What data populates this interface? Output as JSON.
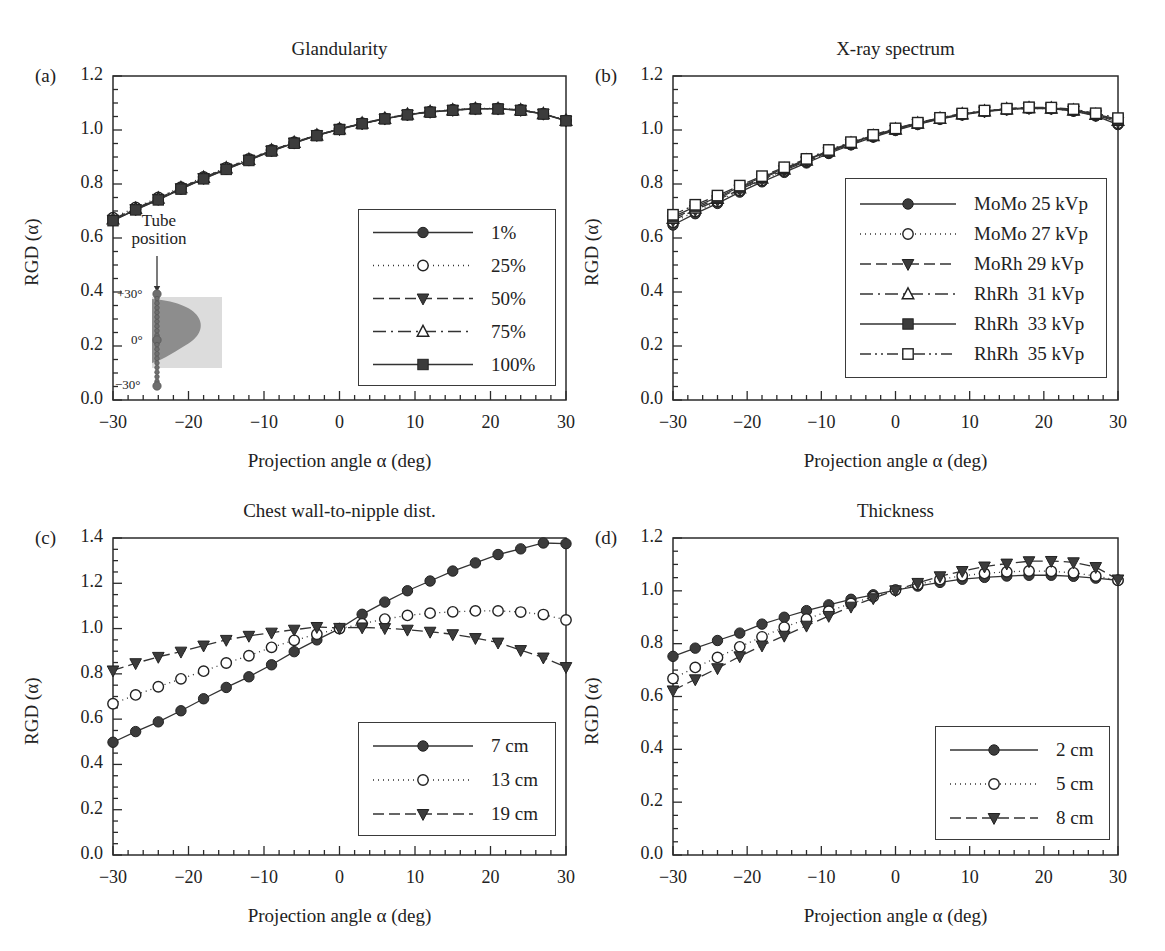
{
  "figure": {
    "background": "#ffffff",
    "ink": "#2b2b2b",
    "axis_title_x": "Projection angle α (deg)",
    "axis_title_y": "RGD (α)"
  },
  "panels": [
    {
      "key": "a",
      "label": "(a)",
      "title": "Glandularity",
      "frame": {
        "x": 113,
        "y": 76,
        "w": 453,
        "h": 324
      },
      "legend": {
        "x": 358,
        "y": 209,
        "w": 198,
        "h": 177,
        "row_h": 33,
        "sample_w": 108
      }
    },
    {
      "key": "b",
      "label": "(b)",
      "title": "X-ray spectrum",
      "frame": {
        "x": 673,
        "y": 76,
        "w": 445,
        "h": 324
      },
      "legend": {
        "x": 845,
        "y": 178,
        "w": 262,
        "h": 200,
        "row_h": 30,
        "sample_w": 104
      }
    },
    {
      "key": "c",
      "label": "(c)",
      "title": "Chest wall-to-nipple dist.",
      "frame": {
        "x": 113,
        "y": 538,
        "w": 453,
        "h": 317
      },
      "legend": {
        "x": 358,
        "y": 722,
        "w": 198,
        "h": 114,
        "row_h": 34,
        "sample_w": 108
      }
    },
    {
      "key": "d",
      "label": "(d)",
      "title": "Thickness",
      "frame": {
        "x": 673,
        "y": 538,
        "w": 445,
        "h": 317
      },
      "legend": {
        "x": 935,
        "y": 726,
        "w": 175,
        "h": 114,
        "row_h": 34,
        "sample_w": 96
      }
    }
  ],
  "inset": {
    "panel": "a",
    "note": "Tube\nposition",
    "note_line1": "Tube",
    "note_line2": "position",
    "labels": [
      "+30°",
      "0°",
      "−30°"
    ],
    "box": {
      "x": 152,
      "y": 297,
      "w": 70,
      "h": 71
    },
    "arrow": {
      "x": 157,
      "y": 256,
      "len": 34
    }
  },
  "chart_data": [
    {
      "type": "line",
      "panel": "a",
      "title": "Glandularity",
      "xlabel": "Projection angle α (deg)",
      "ylabel": "RGD (α)",
      "xlim": [
        -30,
        30
      ],
      "ylim": [
        0.0,
        1.2
      ],
      "xticks": [
        -30,
        -20,
        -10,
        0,
        10,
        20,
        30
      ],
      "yticks": [
        0.0,
        0.2,
        0.4,
        0.6,
        0.8,
        1.0,
        1.2
      ],
      "minor_ticks": true,
      "grid": false,
      "legend_position": "lower-right-inside",
      "x": [
        -30,
        -27,
        -24,
        -21,
        -18,
        -15,
        -12,
        -9,
        -6,
        -3,
        0,
        3,
        6,
        9,
        12,
        15,
        18,
        21,
        24,
        27,
        30
      ],
      "series": [
        {
          "name": "1%",
          "marker": "filled-circle",
          "line": "solid",
          "values": [
            0.665,
            0.705,
            0.742,
            0.782,
            0.82,
            0.855,
            0.888,
            0.923,
            0.952,
            0.98,
            1.003,
            1.024,
            1.042,
            1.057,
            1.067,
            1.074,
            1.079,
            1.079,
            1.074,
            1.06,
            1.035
          ]
        },
        {
          "name": "25%",
          "marker": "open-circle",
          "line": "dotted",
          "values": [
            0.675,
            0.713,
            0.75,
            0.788,
            0.826,
            0.861,
            0.893,
            0.926,
            0.955,
            0.982,
            1.004,
            1.025,
            1.043,
            1.058,
            1.068,
            1.075,
            1.08,
            1.08,
            1.075,
            1.061,
            1.036
          ]
        },
        {
          "name": "50%",
          "marker": "filled-triangle-down",
          "line": "dashed",
          "values": [
            0.668,
            0.707,
            0.745,
            0.784,
            0.822,
            0.857,
            0.89,
            0.924,
            0.953,
            0.981,
            1.003,
            1.024,
            1.042,
            1.057,
            1.067,
            1.074,
            1.079,
            1.079,
            1.074,
            1.06,
            1.035
          ]
        },
        {
          "name": "75%",
          "marker": "open-triangle-up",
          "line": "dashdot",
          "values": [
            0.67,
            0.709,
            0.747,
            0.786,
            0.824,
            0.859,
            0.891,
            0.925,
            0.954,
            0.981,
            1.004,
            1.025,
            1.043,
            1.058,
            1.068,
            1.074,
            1.079,
            1.079,
            1.074,
            1.06,
            1.035
          ]
        },
        {
          "name": "100%",
          "marker": "filled-square",
          "line": "solid",
          "values": [
            0.664,
            0.704,
            0.741,
            0.781,
            0.819,
            0.854,
            0.887,
            0.922,
            0.951,
            0.979,
            1.002,
            1.023,
            1.041,
            1.056,
            1.066,
            1.073,
            1.078,
            1.078,
            1.073,
            1.059,
            1.034
          ]
        }
      ]
    },
    {
      "type": "line",
      "panel": "b",
      "title": "X-ray spectrum",
      "xlabel": "Projection angle α (deg)",
      "ylabel": "RGD (α)",
      "xlim": [
        -30,
        30
      ],
      "ylim": [
        0.0,
        1.2
      ],
      "xticks": [
        -30,
        -20,
        -10,
        0,
        10,
        20,
        30
      ],
      "yticks": [
        0.0,
        0.2,
        0.4,
        0.6,
        0.8,
        1.0,
        1.2
      ],
      "minor_ticks": true,
      "grid": false,
      "legend_position": "center-right-inside",
      "x": [
        -30,
        -27,
        -24,
        -21,
        -18,
        -15,
        -12,
        -9,
        -6,
        -3,
        0,
        3,
        6,
        9,
        12,
        15,
        18,
        21,
        24,
        27,
        30
      ],
      "series": [
        {
          "name": "MoMo 25 kVp",
          "marker": "filled-circle",
          "line": "solid",
          "values": [
            0.648,
            0.69,
            0.728,
            0.77,
            0.808,
            0.843,
            0.878,
            0.913,
            0.945,
            0.974,
            0.999,
            1.021,
            1.04,
            1.056,
            1.068,
            1.076,
            1.08,
            1.079,
            1.07,
            1.052,
            1.02
          ]
        },
        {
          "name": "MoMo 27 kVp",
          "marker": "open-circle",
          "line": "dotted",
          "values": [
            0.658,
            0.698,
            0.735,
            0.776,
            0.813,
            0.848,
            0.882,
            0.916,
            0.947,
            0.976,
            1.0,
            1.022,
            1.041,
            1.057,
            1.069,
            1.076,
            1.08,
            1.079,
            1.071,
            1.054,
            1.025
          ]
        },
        {
          "name": "MoRh 29 kVp",
          "marker": "filled-triangle-down",
          "line": "dashed",
          "values": [
            0.665,
            0.704,
            0.74,
            0.78,
            0.817,
            0.851,
            0.884,
            0.918,
            0.949,
            0.977,
            1.001,
            1.023,
            1.042,
            1.058,
            1.069,
            1.077,
            1.081,
            1.08,
            1.072,
            1.055,
            1.03
          ]
        },
        {
          "name": "RhRh  31 kVp",
          "marker": "open-triangle-up",
          "line": "dashdot",
          "values": [
            0.672,
            0.71,
            0.746,
            0.785,
            0.821,
            0.855,
            0.888,
            0.921,
            0.951,
            0.979,
            1.003,
            1.025,
            1.043,
            1.059,
            1.07,
            1.078,
            1.082,
            1.081,
            1.073,
            1.057,
            1.035
          ]
        },
        {
          "name": "RhRh  33 kVp",
          "marker": "filled-square",
          "line": "solid",
          "values": [
            0.678,
            0.716,
            0.751,
            0.789,
            0.825,
            0.858,
            0.89,
            0.923,
            0.953,
            0.98,
            1.004,
            1.026,
            1.044,
            1.06,
            1.071,
            1.078,
            1.083,
            1.082,
            1.075,
            1.059,
            1.039
          ]
        },
        {
          "name": "RhRh  35 kVp",
          "marker": "open-square",
          "line": "dashdotdot",
          "values": [
            0.686,
            0.723,
            0.757,
            0.794,
            0.829,
            0.862,
            0.893,
            0.926,
            0.955,
            0.982,
            1.006,
            1.027,
            1.045,
            1.061,
            1.072,
            1.079,
            1.084,
            1.083,
            1.077,
            1.062,
            1.044
          ]
        }
      ]
    },
    {
      "type": "line",
      "panel": "c",
      "title": "Chest wall-to-nipple dist.",
      "xlabel": "Projection angle α (deg)",
      "ylabel": "RGD (α)",
      "xlim": [
        -30,
        30
      ],
      "ylim": [
        0.0,
        1.4
      ],
      "xticks": [
        -30,
        -20,
        -10,
        0,
        10,
        20,
        30
      ],
      "yticks": [
        0.0,
        0.2,
        0.4,
        0.6,
        0.8,
        1.0,
        1.2,
        1.4
      ],
      "minor_ticks": true,
      "grid": false,
      "legend_position": "lower-right-inside",
      "x": [
        -30,
        -27,
        -24,
        -21,
        -18,
        -15,
        -12,
        -9,
        -6,
        -3,
        0,
        3,
        6,
        9,
        12,
        15,
        18,
        21,
        24,
        27,
        30
      ],
      "series": [
        {
          "name": "7 cm",
          "marker": "filled-circle",
          "line": "solid",
          "values": [
            0.498,
            0.545,
            0.588,
            0.637,
            0.69,
            0.74,
            0.787,
            0.84,
            0.898,
            0.95,
            1.0,
            1.063,
            1.117,
            1.167,
            1.21,
            1.254,
            1.29,
            1.327,
            1.352,
            1.378,
            1.375
          ]
        },
        {
          "name": "13 cm",
          "marker": "open-circle",
          "line": "dotted",
          "values": [
            0.668,
            0.707,
            0.743,
            0.778,
            0.812,
            0.848,
            0.88,
            0.917,
            0.948,
            0.975,
            1.0,
            1.021,
            1.042,
            1.058,
            1.068,
            1.074,
            1.078,
            1.078,
            1.073,
            1.062,
            1.038
          ]
        },
        {
          "name": "19 cm",
          "marker": "filled-triangle-down",
          "line": "dashed",
          "values": [
            0.815,
            0.847,
            0.875,
            0.898,
            0.925,
            0.95,
            0.968,
            0.982,
            0.995,
            1.007,
            1.003,
            1.005,
            1.002,
            0.995,
            0.986,
            0.975,
            0.958,
            0.938,
            0.905,
            0.872,
            0.83
          ]
        }
      ]
    },
    {
      "type": "line",
      "panel": "d",
      "title": "Thickness",
      "xlabel": "Projection angle α (deg)",
      "ylabel": "RGD (α)",
      "xlim": [
        -30,
        30
      ],
      "ylim": [
        0.0,
        1.2
      ],
      "xticks": [
        -30,
        -20,
        -10,
        0,
        10,
        20,
        30
      ],
      "yticks": [
        0.0,
        0.2,
        0.4,
        0.6,
        0.8,
        1.0,
        1.2
      ],
      "minor_ticks": true,
      "grid": false,
      "legend_position": "lower-right-inside",
      "x": [
        -30,
        -27,
        -24,
        -21,
        -18,
        -15,
        -12,
        -9,
        -6,
        -3,
        0,
        3,
        6,
        9,
        12,
        15,
        18,
        21,
        24,
        27,
        30
      ],
      "series": [
        {
          "name": "2 cm",
          "marker": "filled-circle",
          "line": "solid",
          "values": [
            0.752,
            0.783,
            0.812,
            0.84,
            0.874,
            0.9,
            0.925,
            0.947,
            0.968,
            0.985,
            1.003,
            1.018,
            1.032,
            1.044,
            1.051,
            1.056,
            1.059,
            1.059,
            1.055,
            1.048,
            1.04
          ]
        },
        {
          "name": "5 cm",
          "marker": "open-circle",
          "line": "dotted",
          "values": [
            0.668,
            0.71,
            0.748,
            0.788,
            0.826,
            0.862,
            0.893,
            0.923,
            0.952,
            0.978,
            1.003,
            1.024,
            1.043,
            1.057,
            1.066,
            1.072,
            1.075,
            1.074,
            1.068,
            1.056,
            1.04
          ]
        },
        {
          "name": "8 cm",
          "marker": "filled-triangle-down",
          "line": "dashed",
          "values": [
            0.623,
            0.665,
            0.707,
            0.752,
            0.793,
            0.83,
            0.868,
            0.905,
            0.94,
            0.972,
            1.002,
            1.03,
            1.055,
            1.075,
            1.092,
            1.103,
            1.112,
            1.113,
            1.108,
            1.09,
            1.043
          ]
        }
      ]
    }
  ]
}
